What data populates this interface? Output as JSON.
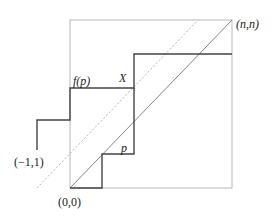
{
  "diagram": {
    "type": "lattice-path",
    "labels": {
      "top_right": "(n,n)",
      "origin": "(0,0)",
      "start": "(−1,1)",
      "upper_path": "f(p)",
      "crossing": "X",
      "lower_path": "p"
    },
    "colors": {
      "box": "#b8b8b8",
      "path": "#444444",
      "diagonal": "#777777",
      "dotted": "#aaaaaa",
      "text": "#222222"
    }
  }
}
